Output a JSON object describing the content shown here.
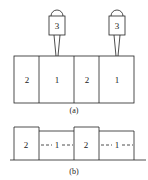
{
  "figure": {
    "stroke_color": "#222222",
    "background": "#ffffff",
    "panel_a": {
      "caption": "(a)",
      "blocks": [
        {
          "label": "2"
        },
        {
          "label": "1"
        },
        {
          "label": "2"
        },
        {
          "label": "1"
        }
      ],
      "probes": [
        {
          "label": "3"
        },
        {
          "label": "3"
        }
      ]
    },
    "panel_b": {
      "caption": "(b)",
      "blocks": [
        {
          "label": "2",
          "height": "tall"
        },
        {
          "label": "1",
          "height": "short"
        },
        {
          "label": "2",
          "height": "tall"
        },
        {
          "label": "1",
          "height": "short"
        }
      ]
    }
  }
}
